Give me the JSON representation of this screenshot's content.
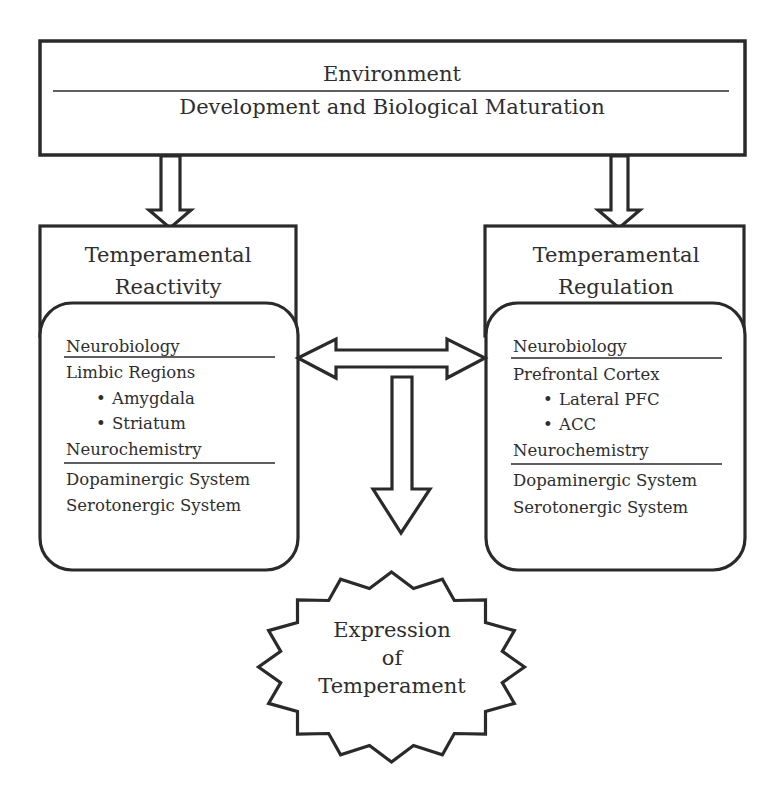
{
  "diagram": {
    "top_box": {
      "line1": "Environment",
      "line2": "Development and Biological Maturation"
    },
    "left_panel": {
      "title_line1": "Temperamental",
      "title_line2": "Reactivity",
      "section1_heading": "Neurobiology",
      "section1_item": "Limbic Regions",
      "section1_bullets": [
        "Amygdala",
        "Striatum"
      ],
      "section2_heading": "Neurochemistry",
      "section2_items": [
        "Dopaminergic System",
        "Serotonergic System"
      ]
    },
    "right_panel": {
      "title_line1": "Temperamental",
      "title_line2": "Regulation",
      "section1_heading": "Neurobiology",
      "section1_item": "Prefrontal Cortex",
      "section1_bullets": [
        "Lateral PFC",
        "ACC"
      ],
      "section2_heading": "Neurochemistry",
      "section2_items": [
        "Dopaminergic System",
        "Serotonergic System"
      ]
    },
    "outcome": {
      "line1": "Expression",
      "line2": "of",
      "line3": "Temperament"
    },
    "bullet_glyph": "•",
    "connections": [
      {
        "from": "top_box",
        "to": "left_panel",
        "type": "down-arrow"
      },
      {
        "from": "top_box",
        "to": "right_panel",
        "type": "down-arrow"
      },
      {
        "from": "left_panel",
        "to": "right_panel",
        "type": "bidirectional-arrow"
      },
      {
        "from": "interaction",
        "to": "outcome",
        "type": "down-arrow"
      }
    ],
    "colors": {
      "stroke": "#2a2a2a",
      "text": "#2e2e2e",
      "background": "#ffffff"
    }
  }
}
